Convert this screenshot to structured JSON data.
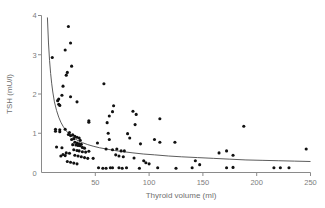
{
  "chart_data": {
    "type": "scatter",
    "title": "",
    "xlabel": "Thyroid volume (ml)",
    "ylabel": "TSH (mU/l)",
    "xlim": [
      0,
      250
    ],
    "ylim": [
      0,
      4
    ],
    "xticks": [
      0,
      50,
      100,
      150,
      200,
      250
    ],
    "yticks": [
      0,
      1,
      2,
      3,
      4
    ],
    "xtick_labels": [
      "0",
      "50",
      "100",
      "150",
      "200",
      "250"
    ],
    "ytick_labels": [
      "0",
      "1",
      "2",
      "3",
      "4"
    ],
    "grid": false,
    "legend": null,
    "marker_color": "#111111",
    "axis_color": "#8a8a8a",
    "curve_color": "#4a4a4a",
    "curve": {
      "name": "fitted inverse curve",
      "description": "decreasing power-law fit",
      "points": [
        [
          5.5,
          3.95
        ],
        [
          6.5,
          3.3
        ],
        [
          7.5,
          2.85
        ],
        [
          8.5,
          2.52
        ],
        [
          9.5,
          2.26
        ],
        [
          10.5,
          2.05
        ],
        [
          12,
          1.8
        ],
        [
          14,
          1.58
        ],
        [
          16,
          1.41
        ],
        [
          18,
          1.28
        ],
        [
          20,
          1.18
        ],
        [
          23,
          1.06
        ],
        [
          26,
          0.97
        ],
        [
          30,
          0.88
        ],
        [
          34,
          0.81
        ],
        [
          38,
          0.76
        ],
        [
          43,
          0.71
        ],
        [
          48,
          0.67
        ],
        [
          54,
          0.63
        ],
        [
          60,
          0.6
        ],
        [
          68,
          0.56
        ],
        [
          76,
          0.53
        ],
        [
          85,
          0.5
        ],
        [
          95,
          0.47
        ],
        [
          105,
          0.45
        ],
        [
          118,
          0.42
        ],
        [
          130,
          0.4
        ],
        [
          145,
          0.38
        ],
        [
          160,
          0.36
        ],
        [
          175,
          0.34
        ],
        [
          190,
          0.32
        ],
        [
          205,
          0.31
        ],
        [
          220,
          0.3
        ],
        [
          235,
          0.29
        ],
        [
          250,
          0.28
        ]
      ]
    },
    "series": [
      {
        "name": "patients",
        "n_points": 111,
        "points": [
          [
            25,
            3.72
          ],
          [
            27,
            3.3
          ],
          [
            22,
            3.12
          ],
          [
            10,
            2.93
          ],
          [
            28,
            2.71
          ],
          [
            24,
            2.55
          ],
          [
            23,
            2.48
          ],
          [
            20,
            2.2
          ],
          [
            58,
            2.26
          ],
          [
            19,
            1.97
          ],
          [
            27,
            1.93
          ],
          [
            16,
            1.87
          ],
          [
            15,
            1.83
          ],
          [
            33,
            1.8
          ],
          [
            16,
            1.74
          ],
          [
            17,
            1.71
          ],
          [
            67,
            1.7
          ],
          [
            66,
            1.55
          ],
          [
            85,
            1.56
          ],
          [
            88,
            1.48
          ],
          [
            63,
            1.44
          ],
          [
            110,
            1.37
          ],
          [
            44,
            1.32
          ],
          [
            44,
            1.28
          ],
          [
            61,
            1.27
          ],
          [
            87,
            1.22
          ],
          [
            188,
            1.18
          ],
          [
            22,
            1.1
          ],
          [
            13,
            1.1
          ],
          [
            17,
            1.09
          ],
          [
            13,
            1.05
          ],
          [
            17,
            1.04
          ],
          [
            26,
            1.02
          ],
          [
            62,
            1.0
          ],
          [
            80,
            0.99
          ],
          [
            25,
            0.97
          ],
          [
            29,
            0.96
          ],
          [
            27,
            0.94
          ],
          [
            31,
            0.92
          ],
          [
            33,
            0.9
          ],
          [
            35,
            0.88
          ],
          [
            30,
            0.86
          ],
          [
            28,
            0.84
          ],
          [
            36,
            0.82
          ],
          [
            63,
            0.84
          ],
          [
            82,
            0.88
          ],
          [
            105,
            0.84
          ],
          [
            124,
            0.77
          ],
          [
            110,
            0.77
          ],
          [
            92,
            0.73
          ],
          [
            31,
            0.77
          ],
          [
            33,
            0.75
          ],
          [
            35,
            0.73
          ],
          [
            37,
            0.72
          ],
          [
            29,
            0.71
          ],
          [
            32,
            0.7
          ],
          [
            34,
            0.69
          ],
          [
            36,
            0.68
          ],
          [
            14,
            0.65
          ],
          [
            19,
            0.63
          ],
          [
            38,
            0.64
          ],
          [
            40,
            0.62
          ],
          [
            52,
            0.75
          ],
          [
            60,
            0.6
          ],
          [
            66,
            0.58
          ],
          [
            70,
            0.6
          ],
          [
            74,
            0.55
          ],
          [
            77,
            0.55
          ],
          [
            246,
            0.6
          ],
          [
            172,
            0.55
          ],
          [
            165,
            0.5
          ],
          [
            178,
            0.44
          ],
          [
            30,
            0.58
          ],
          [
            33,
            0.56
          ],
          [
            35,
            0.55
          ],
          [
            38,
            0.53
          ],
          [
            41,
            0.52
          ],
          [
            44,
            0.54
          ],
          [
            23,
            0.5
          ],
          [
            26,
            0.49
          ],
          [
            20,
            0.46
          ],
          [
            22,
            0.43
          ],
          [
            18,
            0.42
          ],
          [
            31,
            0.44
          ],
          [
            34,
            0.42
          ],
          [
            37,
            0.4
          ],
          [
            40,
            0.38
          ],
          [
            43,
            0.36
          ],
          [
            48,
            0.36
          ],
          [
            69,
            0.45
          ],
          [
            72,
            0.42
          ],
          [
            76,
            0.4
          ],
          [
            86,
            0.37
          ],
          [
            95,
            0.3
          ],
          [
            97,
            0.25
          ],
          [
            100,
            0.22
          ],
          [
            143,
            0.3
          ],
          [
            147,
            0.2
          ],
          [
            24,
            0.28
          ],
          [
            27,
            0.26
          ],
          [
            30,
            0.24
          ],
          [
            33,
            0.22
          ],
          [
            53,
            0.12
          ],
          [
            57,
            0.11
          ],
          [
            60,
            0.11
          ],
          [
            64,
            0.12
          ],
          [
            66,
            0.12
          ],
          [
            72,
            0.12
          ],
          [
            75,
            0.11
          ],
          [
            79,
            0.12
          ],
          [
            91,
            0.11
          ],
          [
            108,
            0.12
          ],
          [
            125,
            0.11
          ],
          [
            140,
            0.12
          ],
          [
            172,
            0.12
          ],
          [
            178,
            0.13
          ],
          [
            216,
            0.12
          ],
          [
            222,
            0.12
          ],
          [
            230,
            0.12
          ]
        ]
      }
    ]
  }
}
